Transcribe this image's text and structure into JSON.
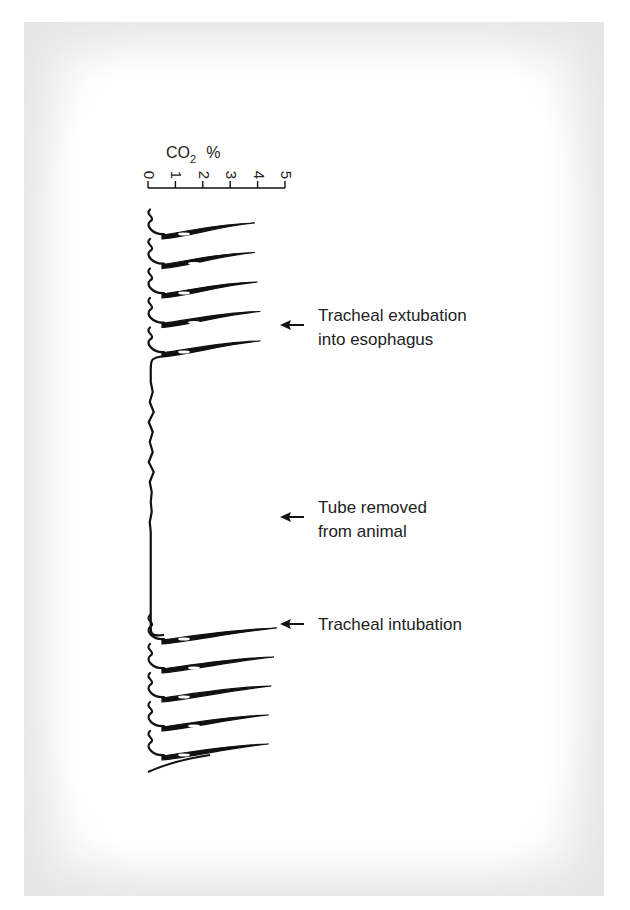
{
  "chart_data": {
    "type": "line",
    "orientation": "vertical-time",
    "title": "",
    "axis": {
      "label_main": "CO",
      "label_sub": "2",
      "label_unit": "%",
      "range": [
        0,
        5
      ],
      "ticks": [
        "0",
        "1",
        "2",
        "3",
        "4",
        "5"
      ]
    },
    "series": [
      {
        "name": "Capnogram (before extubation)",
        "segment": "before",
        "peaks_percent": [
          3.9,
          3.9,
          4.0,
          4.1,
          4.1
        ],
        "baseline_percent": 0.0
      },
      {
        "name": "Esophageal / tube removed (flat)",
        "segment": "flat",
        "value_percent": 0.1
      },
      {
        "name": "Capnogram (after intubation)",
        "segment": "after",
        "peaks_percent": [
          4.7,
          4.6,
          4.5,
          4.4,
          4.4
        ],
        "baseline_percent": 0.0
      }
    ],
    "annotations": [
      {
        "lines": [
          "Tracheal extubation",
          "into esophagus"
        ],
        "event": "extubation"
      },
      {
        "lines": [
          "Tube removed",
          "from animal"
        ],
        "event": "tube-removed"
      },
      {
        "lines": [
          "Tracheal intubation"
        ],
        "event": "intubation"
      }
    ]
  }
}
